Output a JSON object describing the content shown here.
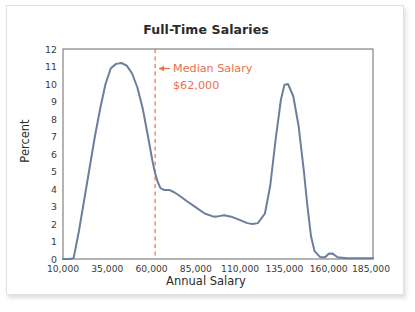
{
  "figure": {
    "title": "Full-Time Salaries"
  },
  "chart_data": {
    "type": "line",
    "title": "Full-Time Salaries",
    "xlabel": "Annual Salary",
    "ylabel": "Percent",
    "xlim": [
      10000,
      185000
    ],
    "ylim": [
      0,
      12
    ],
    "grid": false,
    "legend": null,
    "xticks": [
      "10,000",
      "35,000",
      "60,000",
      "85,000",
      "110,000",
      "135,000",
      "160,000",
      "185,000"
    ],
    "xtick_values": [
      10000,
      35000,
      60000,
      85000,
      110000,
      135000,
      160000,
      185000
    ],
    "yticks": [
      "0",
      "1",
      "2",
      "3",
      "4",
      "5",
      "6",
      "7",
      "8",
      "9",
      "10",
      "11",
      "12"
    ],
    "ytick_values": [
      0,
      1,
      2,
      3,
      4,
      5,
      6,
      7,
      8,
      9,
      10,
      11,
      12
    ],
    "series": [
      {
        "name": "Full-Time Salaries density",
        "color": "#6d7d9e",
        "x": [
          10000,
          14000,
          16000,
          19000,
          22000,
          25000,
          28000,
          31000,
          34000,
          37000,
          40000,
          43000,
          46000,
          49000,
          52000,
          55000,
          58000,
          60500,
          62000,
          63500,
          65000,
          67000,
          70000,
          73000,
          76000,
          80000,
          85000,
          90000,
          95000,
          98000,
          101000,
          105000,
          110000,
          114000,
          117000,
          120000,
          124000,
          127000,
          130000,
          133000,
          135000,
          137000,
          140000,
          143000,
          146000,
          148000,
          150000,
          152000,
          155000,
          158000,
          160000,
          162000,
          165000,
          170000,
          176000,
          180000,
          185000
        ],
        "y": [
          0.0,
          0.0,
          0.05,
          1.6,
          3.4,
          5.2,
          7.0,
          8.6,
          10.0,
          10.9,
          11.15,
          11.2,
          11.05,
          10.6,
          9.8,
          8.6,
          7.0,
          5.6,
          4.9,
          4.4,
          4.05,
          3.95,
          3.95,
          3.8,
          3.6,
          3.3,
          2.95,
          2.6,
          2.42,
          2.45,
          2.5,
          2.42,
          2.22,
          2.05,
          2.0,
          2.05,
          2.6,
          4.2,
          6.8,
          9.1,
          9.95,
          10.0,
          9.3,
          7.6,
          5.0,
          3.0,
          1.3,
          0.45,
          0.12,
          0.1,
          0.3,
          0.32,
          0.1,
          0.05,
          0.05,
          0.05,
          0.05
        ]
      }
    ],
    "annotations": [
      {
        "name": "median-salary-marker",
        "kind": "vertical-dashed-line",
        "x_value": 62000,
        "color": "#e8714a",
        "arrow": "←",
        "label_line1": "Median Salary",
        "label_line2": "$62,000"
      }
    ]
  }
}
